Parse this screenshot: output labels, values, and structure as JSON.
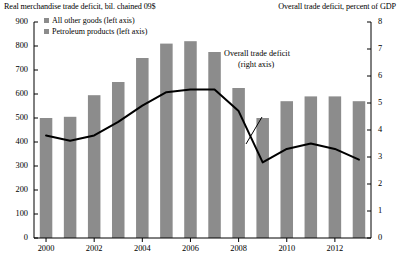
{
  "titles": {
    "left": "Real merchandise trade deficit, bil. chained 09$",
    "right": "Overall trade deficit, percent of GDP"
  },
  "legend": {
    "items": [
      {
        "label": "All other goods (left axis)",
        "color": "#8c8c8c",
        "icon": "square-swatch-icon"
      },
      {
        "label": "Petroleum products (left axis)",
        "color": "#8c8c8c",
        "icon": "square-swatch-icon"
      }
    ]
  },
  "annotation": {
    "line1": "Overall trade deficit",
    "line2": "(right axis)"
  },
  "axes": {
    "left_ticks": [
      "900",
      "800",
      "700",
      "600",
      "500",
      "400",
      "300",
      "200",
      "100",
      "0"
    ],
    "right_ticks": [
      "8",
      "7",
      "6",
      "5",
      "4",
      "3",
      "2",
      "1",
      "0"
    ],
    "x_ticks": [
      "2000",
      "2002",
      "2004",
      "2006",
      "2008",
      "2010",
      "2012"
    ]
  },
  "chart_data": {
    "type": "bar",
    "title": "Real merchandise trade deficit, bil. chained 09$",
    "xlabel": "",
    "ylabel": "Real merchandise trade deficit, bil. chained 09$",
    "y2label": "Overall trade deficit, percent of GDP",
    "ylim": [
      0,
      900
    ],
    "y2lim": [
      0,
      8
    ],
    "grid": false,
    "legend_position": "top-left",
    "categories": [
      2000,
      2001,
      2002,
      2003,
      2004,
      2005,
      2006,
      2007,
      2008,
      2009,
      2010,
      2011,
      2012,
      2013
    ],
    "series": [
      {
        "name": "Merchandise trade deficit (bars, left axis)",
        "type": "bar",
        "color": "#8c8c8c",
        "values": [
          500,
          505,
          595,
          650,
          750,
          810,
          820,
          775,
          625,
          500,
          570,
          590,
          590,
          570
        ]
      },
      {
        "name": "Overall trade deficit (right axis)",
        "type": "line",
        "color": "#000000",
        "axis": "right",
        "values": [
          3.8,
          3.6,
          3.8,
          4.3,
          4.9,
          5.4,
          5.5,
          5.5,
          4.7,
          2.8,
          3.3,
          3.5,
          3.3,
          2.9
        ]
      }
    ]
  }
}
